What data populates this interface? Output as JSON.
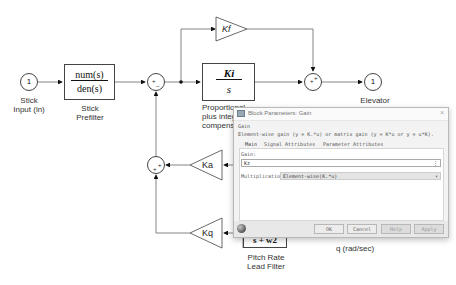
{
  "diagram": {
    "inport": {
      "number": "1",
      "label_line1": "Stick",
      "label_line2": "Input (in)"
    },
    "prefilter": {
      "numerator": "num(s)",
      "denominator": "den(s)",
      "label_line1": "Stick",
      "label_line2": "Prefilter"
    },
    "kf_gain": {
      "label": "Kf"
    },
    "pi_block": {
      "numerator": "Ki",
      "denominator": "s",
      "label_line1": "Proportional",
      "label_line2": "plus integral",
      "label_line3": "compensator"
    },
    "outport": {
      "number": "1",
      "label_line1": "Elevator",
      "label_line2": "Command (deg)"
    },
    "ka_gain": {
      "label": "Ka"
    },
    "kq_gain": {
      "label": "Kq"
    },
    "lead_filter": {
      "partial_text": "s + w2",
      "label_line1": "Pitch Rate",
      "label_line2": "Lead Filter"
    },
    "q_label": "q (rad/sec)"
  },
  "dialog": {
    "title": "Block Parameters: Gain",
    "block_type": "Gain",
    "description": "Element-wise gain (y = K.*u) or matrix gain (y = K*u or y = u*K).",
    "tabs": [
      {
        "label": "Main",
        "active": true
      },
      {
        "label": "Signal Attributes",
        "active": false
      },
      {
        "label": "Parameter Attributes",
        "active": false
      }
    ],
    "gain_label": "Gain:",
    "gain_value": "Kz",
    "gain_more": "⋮",
    "multiplication_label": "Multiplication:",
    "multiplication_value": "Element-wise(K.*u)",
    "buttons": {
      "ok": "OK",
      "cancel": "Cancel",
      "help": "Help",
      "apply": "Apply"
    },
    "close_glyph": "×"
  }
}
